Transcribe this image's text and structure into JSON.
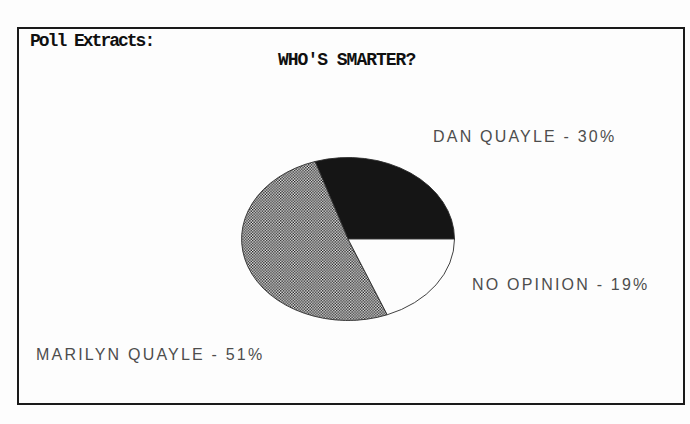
{
  "artifacts": {
    "top_clipped_text": "smarter of the two"
  },
  "header": {
    "frame_label": "Poll Extracts:"
  },
  "chart_data": {
    "type": "pie",
    "title": "WHO'S SMARTER?",
    "start_angle_deg": 0,
    "direction": "counterclockwise",
    "legend_position": "callout-labels",
    "slices": [
      {
        "label": "DAN QUAYLE",
        "value": 30,
        "display": "DAN QUAYLE - 30%",
        "fill": "solid-black"
      },
      {
        "label": "MARILYN QUAYLE",
        "value": 51,
        "display": "MARILYN QUAYLE - 51%",
        "fill": "dither-gray"
      },
      {
        "label": "NO OPINION",
        "value": 19,
        "display": "NO OPINION - 19%",
        "fill": "white"
      }
    ]
  },
  "colors": {
    "page_bg": "#fdfdfd",
    "frame_border": "#1a1a1a",
    "title_text": "#101010",
    "callout_text": "#4d4d4d",
    "clipped_text": "#8f8f8f",
    "slice_black": "#151515",
    "slice_white": "#fdfdfd",
    "dither_dot": "#1a1a1a",
    "dither_bg": "#f2f2f2",
    "pie_outline": "#2b2b2b"
  }
}
